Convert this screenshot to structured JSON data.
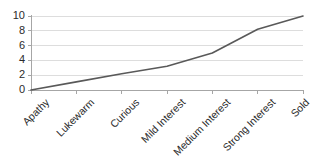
{
  "chart_data": {
    "type": "line",
    "title": "",
    "subtitle": "",
    "xlabel": "",
    "ylabel": "",
    "categories": [
      "Apathy",
      "Lukewarm",
      "Curious",
      "Mild Interest",
      "Medium Interest",
      "Strong Interest",
      "Sold"
    ],
    "values": [
      0,
      1.1,
      2.2,
      3.2,
      5.0,
      8.2,
      10
    ],
    "series": [
      {
        "name": "",
        "values": [
          0,
          1.1,
          2.2,
          3.2,
          5.0,
          8.2,
          10
        ],
        "color": "#595959"
      }
    ],
    "ylim": [
      0,
      10
    ],
    "yticks": [
      0,
      2,
      4,
      6,
      8,
      10
    ],
    "ytick_labels": [
      "0",
      "2",
      "4",
      "6",
      "8",
      "10"
    ],
    "grid": true,
    "grid_axis": "y",
    "legend": false,
    "legend_position": "none",
    "xtick_label_rotation": -45,
    "colors": {
      "line": "#595959",
      "gridline": "#d4d4d4",
      "axis": "#a6a6a6",
      "text": "#2b2b2b",
      "background": "#ffffff"
    }
  },
  "axes": {
    "y_ticks": [
      {
        "label": "10",
        "value": 10
      },
      {
        "label": "8",
        "value": 8
      },
      {
        "label": "6",
        "value": 6
      },
      {
        "label": "4",
        "value": 4
      },
      {
        "label": "2",
        "value": 2
      },
      {
        "label": "0",
        "value": 0
      }
    ],
    "x_ticks": [
      {
        "label": "Apathy"
      },
      {
        "label": "Lukewarm"
      },
      {
        "label": "Curious"
      },
      {
        "label": "Mild Interest"
      },
      {
        "label": "Medium Interest"
      },
      {
        "label": "Strong Interest"
      },
      {
        "label": "Sold"
      }
    ]
  }
}
